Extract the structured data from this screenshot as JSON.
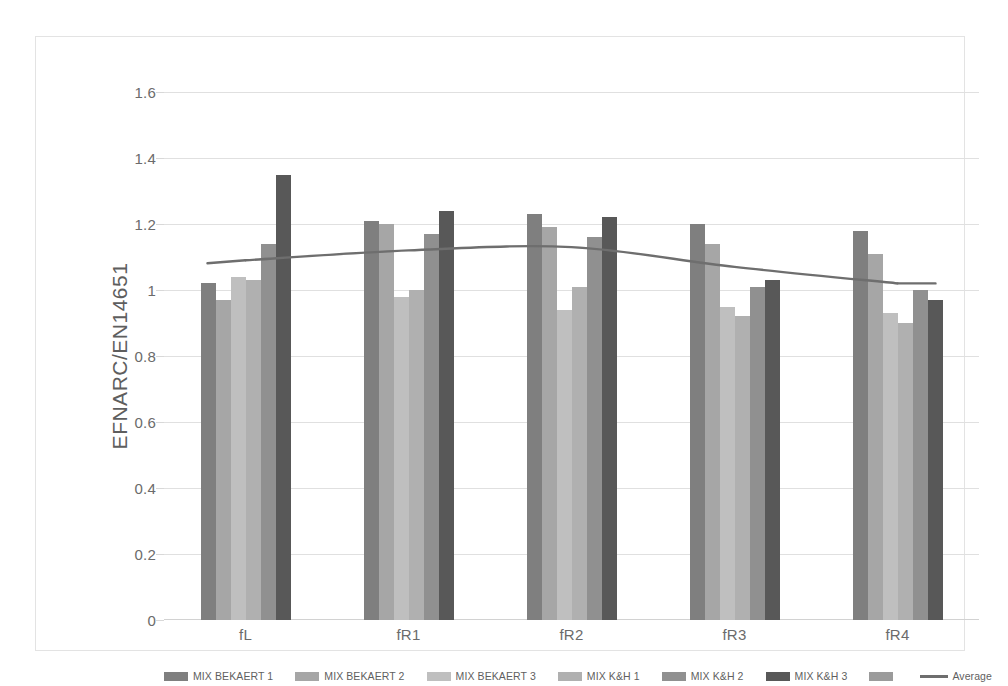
{
  "chart_data": {
    "type": "bar",
    "title": "",
    "xlabel": "",
    "ylabel": "EFNARC/EN14651",
    "ylim": [
      0,
      1.6
    ],
    "ytick_values": [
      0,
      0.2,
      0.4,
      0.6,
      0.8,
      1,
      1.2,
      1.4,
      1.6
    ],
    "ytick_labels": [
      "0",
      "0.2",
      "0.4",
      "0.6",
      "0.8",
      "1",
      "1.2",
      "1.4",
      "1.6"
    ],
    "grid": true,
    "legend_position": "bottom",
    "categories": [
      "fL",
      "fR1",
      "fR2",
      "fR3",
      "fR4"
    ],
    "series": [
      {
        "name": "MIX BEKAERT 1",
        "color": "#7f7f7f",
        "values": [
          1.02,
          1.21,
          1.23,
          1.2,
          1.18
        ]
      },
      {
        "name": "MIX BEKAERT 2",
        "color": "#a6a6a6",
        "values": [
          0.97,
          1.2,
          1.19,
          1.14,
          1.11
        ]
      },
      {
        "name": "MIX BEKAERT 3",
        "color": "#bfbfbf",
        "values": [
          1.04,
          0.98,
          0.94,
          0.95,
          0.93
        ]
      },
      {
        "name": "MIX K&H 1",
        "color": "#b0b0b0",
        "values": [
          1.03,
          1.0,
          1.01,
          0.92,
          0.9
        ]
      },
      {
        "name": "MIX K&H 2",
        "color": "#909090",
        "values": [
          1.14,
          1.17,
          1.16,
          1.01,
          1.0
        ]
      },
      {
        "name": "MIX K&H 3",
        "color": "#585858",
        "values": [
          1.35,
          1.24,
          1.22,
          1.03,
          0.97
        ]
      }
    ],
    "line_series": {
      "name": "Average",
      "color": "#6e6e6e",
      "values": [
        1.09,
        1.12,
        1.13,
        1.07,
        1.02
      ],
      "smooth": true
    },
    "legend_entries": [
      {
        "label": "MIX BEKAERT 1",
        "color": "#7f7f7f",
        "type": "swatch"
      },
      {
        "label": "MIX BEKAERT 2",
        "color": "#a6a6a6",
        "type": "swatch"
      },
      {
        "label": "MIX BEKAERT 3",
        "color": "#bfbfbf",
        "type": "swatch"
      },
      {
        "label": "MIX K&H 1",
        "color": "#b0b0b0",
        "type": "swatch"
      },
      {
        "label": "MIX K&H 2",
        "color": "#909090",
        "type": "swatch"
      },
      {
        "label": "MIX K&H 3",
        "color": "#585858",
        "type": "swatch"
      },
      {
        "label": "",
        "color": "#9b9b9b",
        "type": "swatch"
      },
      {
        "label": "Average",
        "color": "#6e6e6e",
        "type": "line"
      }
    ]
  }
}
